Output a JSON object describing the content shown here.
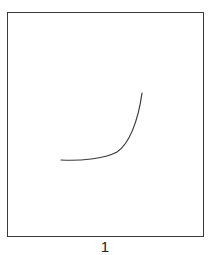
{
  "diagram": {
    "panel_label": "1",
    "stroke_color": "#3a3a3a",
    "curve": {
      "description": "exponential-style curve rising sharply to the right",
      "points": [
        [
          61,
          160
        ],
        [
          80,
          161
        ],
        [
          100,
          159
        ],
        [
          117,
          153
        ],
        [
          128,
          140
        ],
        [
          136,
          122
        ],
        [
          142,
          93
        ]
      ]
    }
  }
}
